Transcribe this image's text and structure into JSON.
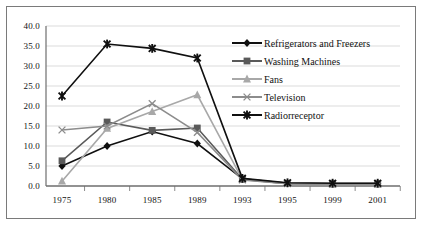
{
  "chart_data": {
    "type": "line",
    "title": "",
    "xlabel": "",
    "ylabel": "",
    "categories": [
      "1975",
      "1980",
      "1985",
      "1989",
      "1993",
      "1995",
      "1999",
      "2001"
    ],
    "ylim": [
      0.0,
      40.0
    ],
    "ytick_labels": [
      "0.0",
      "5.0",
      "10.0",
      "15.0",
      "20.0",
      "25.0",
      "30.0",
      "35.0",
      "40.0"
    ],
    "ytick_values": [
      0.0,
      5.0,
      10.0,
      15.0,
      20.0,
      25.0,
      30.0,
      35.0,
      40.0
    ],
    "grid": true,
    "legend_position": "right",
    "series": [
      {
        "name": "Refrigerators and Freezers",
        "color": "#101010",
        "marker": "diamond",
        "values": [
          5.0,
          10.0,
          13.6,
          10.6,
          1.8,
          0.7,
          0.6,
          0.6
        ]
      },
      {
        "name": "Washing Machines",
        "color": "#5a5a5a",
        "marker": "square",
        "values": [
          6.3,
          16.0,
          13.9,
          14.5,
          1.7,
          0.6,
          0.5,
          0.5
        ]
      },
      {
        "name": "Fans",
        "color": "#a8a8a8",
        "marker": "triangle",
        "values": [
          1.2,
          14.4,
          18.6,
          22.8,
          1.6,
          0.6,
          0.5,
          0.5
        ]
      },
      {
        "name": "Television",
        "color": "#8c8c8c",
        "marker": "cross",
        "values": [
          14.0,
          15.0,
          20.6,
          13.4,
          1.5,
          0.6,
          0.5,
          0.5
        ]
      },
      {
        "name": "Radiorreceptor",
        "color": "#101010",
        "marker": "star",
        "values": [
          22.5,
          35.5,
          34.4,
          32.0,
          1.9,
          0.8,
          0.7,
          0.7
        ]
      }
    ]
  }
}
